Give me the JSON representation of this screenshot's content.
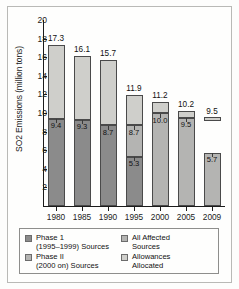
{
  "chart_data": {
    "type": "bar",
    "title": "",
    "xlabel": "",
    "ylabel": "SO2 Emissions (million tons)",
    "ylim": [
      0,
      20
    ],
    "ytick_labels": [
      "2",
      "4",
      "6",
      "8",
      "10",
      "12",
      "14",
      "16",
      "18",
      "20"
    ],
    "ytick_values": [
      2,
      4,
      6,
      8,
      10,
      12,
      14,
      16,
      18,
      20
    ],
    "grid": false,
    "legend_position": "below-axes",
    "categories": [
      "1980",
      "1985",
      "1990",
      "1995",
      "2000",
      "2005",
      "2009"
    ],
    "series": [
      {
        "name": "Phase 1 (1995-1999) Sources",
        "values": [
          9.4,
          9.3,
          8.7,
          5.3,
          null,
          null,
          null
        ]
      },
      {
        "name": "Phase II (2000 on) Sources",
        "values": [
          null,
          null,
          null,
          8.7,
          null,
          null,
          null
        ]
      },
      {
        "name": "All Affected Sources",
        "values": [
          null,
          null,
          null,
          null,
          10.0,
          9.5,
          5.7
        ]
      },
      {
        "name": "Allowances Allocated",
        "values": [
          17.3,
          16.1,
          15.7,
          11.9,
          11.2,
          10.2,
          9.5
        ]
      }
    ],
    "bars": [
      {
        "year": "1980",
        "top_label": "17.3",
        "allowances": 17.3,
        "segments": [
          {
            "kind": "phase1",
            "from": 0,
            "to": 9.4,
            "label": "9.4"
          },
          {
            "kind": "allowance",
            "from": 9.4,
            "to": 17.3,
            "label": ""
          }
        ]
      },
      {
        "year": "1985",
        "top_label": "16.1",
        "allowances": 16.1,
        "segments": [
          {
            "kind": "phase1",
            "from": 0,
            "to": 9.3,
            "label": "9.3"
          },
          {
            "kind": "allowance",
            "from": 9.3,
            "to": 16.1,
            "label": ""
          }
        ]
      },
      {
        "year": "1990",
        "top_label": "15.7",
        "allowances": 15.7,
        "segments": [
          {
            "kind": "phase1",
            "from": 0,
            "to": 8.7,
            "label": "8.7"
          },
          {
            "kind": "allowance",
            "from": 8.7,
            "to": 15.7,
            "label": ""
          }
        ]
      },
      {
        "year": "1995",
        "top_label": "11.9",
        "allowances": 11.9,
        "segments": [
          {
            "kind": "phase1",
            "from": 0,
            "to": 5.3,
            "label": "5.3"
          },
          {
            "kind": "phase2",
            "from": 5.3,
            "to": 8.7,
            "label": "8.7"
          },
          {
            "kind": "allowance",
            "from": 8.7,
            "to": 11.9,
            "label": ""
          }
        ]
      },
      {
        "year": "2000",
        "top_label": "11.2",
        "allowances": 11.2,
        "segments": [
          {
            "kind": "affected",
            "from": 0,
            "to": 10.0,
            "label": "10.0"
          },
          {
            "kind": "allowance",
            "from": 10.0,
            "to": 11.2,
            "label": ""
          }
        ]
      },
      {
        "year": "2005",
        "top_label": "10.2",
        "allowances": 10.2,
        "segments": [
          {
            "kind": "affected",
            "from": 0,
            "to": 9.5,
            "label": "9.5"
          },
          {
            "kind": "allowance",
            "from": 9.5,
            "to": 10.2,
            "label": ""
          }
        ]
      },
      {
        "year": "2009",
        "top_label": "9.5",
        "allowances": 9.5,
        "floating_allowance": {
          "from": 9.2,
          "to": 9.6
        },
        "segments": [
          {
            "kind": "affected",
            "from": 0,
            "to": 5.7,
            "label": "5.7"
          }
        ]
      }
    ]
  },
  "legend": {
    "items": [
      {
        "swatch": "phase1",
        "line1": "Phase 1",
        "line2": "(1995–1999) Sources"
      },
      {
        "swatch": "affected",
        "line1": "All Affected",
        "line2": "Sources"
      },
      {
        "swatch": "phase2",
        "line1": "Phase II",
        "line2": "(2000 on) Sources"
      },
      {
        "swatch": "allowance",
        "line1": "Allowances",
        "line2": "Allocated"
      }
    ]
  },
  "colors": {
    "phase1": "#8b8b8b",
    "phase2": "#b4b4b2",
    "affected": "#b4b4b2",
    "allowance": "#cfcfcb",
    "axis": "#1b1b1b",
    "frame": "#b9b9b6"
  }
}
